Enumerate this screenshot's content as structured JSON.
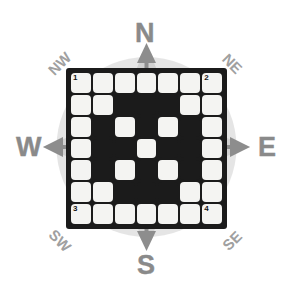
{
  "diagram": {
    "colors": {
      "board_background": "#1b1b1b",
      "cell_on": "#f4f4f2",
      "compass_letter": "#8a8a8a",
      "ordinal_letter": "#a0a0a0",
      "starburst": "#b3b3b3",
      "arrow": "#8a8a8a",
      "page_background": "#ffffff"
    }
  },
  "compass": {
    "cardinals": [
      {
        "key": "north",
        "label": "N"
      },
      {
        "key": "east",
        "label": "E"
      },
      {
        "key": "south",
        "label": "S"
      },
      {
        "key": "west",
        "label": "W"
      }
    ],
    "ordinals": [
      {
        "key": "northwest",
        "label": "NW"
      },
      {
        "key": "northeast",
        "label": "NE"
      },
      {
        "key": "southwest",
        "label": "SW"
      },
      {
        "key": "southeast",
        "label": "SE"
      }
    ]
  },
  "grid": {
    "rows": 7,
    "cols": 7,
    "legend": {
      "on": "white cell",
      "off": "black cell"
    },
    "cells": [
      [
        1,
        1,
        1,
        1,
        1,
        1,
        1
      ],
      [
        1,
        1,
        0,
        0,
        0,
        1,
        1
      ],
      [
        1,
        0,
        1,
        0,
        1,
        0,
        1
      ],
      [
        1,
        0,
        0,
        1,
        0,
        0,
        1
      ],
      [
        1,
        0,
        1,
        0,
        1,
        0,
        1
      ],
      [
        1,
        1,
        0,
        0,
        0,
        1,
        1
      ],
      [
        1,
        1,
        1,
        1,
        1,
        1,
        1
      ]
    ],
    "corner_labels": [
      {
        "row": 0,
        "col": 0,
        "label": "1"
      },
      {
        "row": 0,
        "col": 6,
        "label": "2"
      },
      {
        "row": 6,
        "col": 0,
        "label": "3"
      },
      {
        "row": 6,
        "col": 6,
        "label": "4"
      }
    ]
  }
}
